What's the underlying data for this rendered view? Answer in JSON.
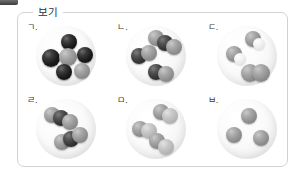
{
  "frame": {
    "legend_label": "보기",
    "border_color": "#d2d2d2",
    "background_color": "#ffffff"
  },
  "atom_colors": {
    "black": "#141414",
    "dark": "#333333",
    "gray": "#9a9a9a",
    "light_gray": "#c2c2c2",
    "white": "#f2f2f2"
  },
  "panels": [
    {
      "label": "ㄱ.",
      "name": "panel-g",
      "description": "six separate atoms: three black, three gray",
      "molecule_count": 6,
      "atom_count": 6,
      "molecules": [
        {
          "atoms": [
            {
              "type": "black",
              "x": 25,
              "y": 8,
              "r": 8
            }
          ]
        },
        {
          "atoms": [
            {
              "type": "black",
              "x": 6,
              "y": 23,
              "r": 9
            }
          ]
        },
        {
          "atoms": [
            {
              "type": "gray",
              "x": 23,
              "y": 22,
              "r": 9
            }
          ]
        },
        {
          "atoms": [
            {
              "type": "black",
              "x": 41,
              "y": 21,
              "r": 8
            }
          ]
        },
        {
          "atoms": [
            {
              "type": "black",
              "x": 20,
              "y": 38,
              "r": 8
            }
          ]
        },
        {
          "atoms": [
            {
              "type": "gray",
              "x": 38,
              "y": 37,
              "r": 8
            }
          ]
        }
      ]
    },
    {
      "label": "ㄴ.",
      "name": "panel-n",
      "description": "one triatomic gray-dark-gray molecule and two diatomic dark-gray molecules",
      "molecule_count": 3,
      "atom_count": 7,
      "molecules": [
        {
          "atoms": [
            {
              "type": "gray",
              "x": 22,
              "y": 4,
              "r": 8
            },
            {
              "type": "dark",
              "x": 31,
              "y": 9,
              "r": 8
            },
            {
              "type": "gray",
              "x": 40,
              "y": 13,
              "r": 8
            }
          ]
        },
        {
          "atoms": [
            {
              "type": "dark",
              "x": 5,
              "y": 22,
              "r": 8
            },
            {
              "type": "gray",
              "x": 15,
              "y": 19,
              "r": 8
            }
          ]
        },
        {
          "atoms": [
            {
              "type": "dark",
              "x": 22,
              "y": 38,
              "r": 8
            },
            {
              "type": "gray",
              "x": 32,
              "y": 40,
              "r": 8
            }
          ]
        }
      ]
    },
    {
      "label": "ㄷ.",
      "name": "panel-d",
      "description": "two dark atoms each bonded to a white atom, plus one diatomic gray molecule",
      "molecule_count": 3,
      "atom_count": 6,
      "molecules": [
        {
          "atoms": [
            {
              "type": "gray",
              "x": 28,
              "y": 5,
              "r": 8
            },
            {
              "type": "white",
              "x": 36,
              "y": 12,
              "r": 6
            }
          ]
        },
        {
          "atoms": [
            {
              "type": "gray",
              "x": 9,
              "y": 20,
              "r": 8
            },
            {
              "type": "white",
              "x": 17,
              "y": 27,
              "r": 6
            }
          ]
        },
        {
          "atoms": [
            {
              "type": "gray",
              "x": 24,
              "y": 38,
              "r": 9
            },
            {
              "type": "gray",
              "x": 35,
              "y": 38,
              "r": 9
            }
          ]
        }
      ]
    },
    {
      "label": "ㄹ.",
      "name": "panel-r",
      "description": "two identical triatomic gray-dark-gray molecules",
      "molecule_count": 2,
      "atom_count": 6,
      "molecules": [
        {
          "atoms": [
            {
              "type": "gray",
              "x": 8,
              "y": 8,
              "r": 8
            },
            {
              "type": "dark",
              "x": 17,
              "y": 11,
              "r": 8
            },
            {
              "type": "gray",
              "x": 26,
              "y": 15,
              "r": 8
            }
          ]
        },
        {
          "atoms": [
            {
              "type": "gray",
              "x": 18,
              "y": 35,
              "r": 8
            },
            {
              "type": "dark",
              "x": 27,
              "y": 32,
              "r": 8
            },
            {
              "type": "gray",
              "x": 36,
              "y": 28,
              "r": 8
            }
          ]
        }
      ]
    },
    {
      "label": "ㅁ.",
      "name": "panel-m",
      "description": "three identical diatomic molecules, each a gray atom bonded to a light gray atom",
      "molecule_count": 3,
      "atom_count": 6,
      "molecules": [
        {
          "atoms": [
            {
              "type": "gray",
              "x": 27,
              "y": 5,
              "r": 8
            },
            {
              "type": "lgray",
              "x": 36,
              "y": 9,
              "r": 8
            }
          ]
        },
        {
          "atoms": [
            {
              "type": "gray",
              "x": 6,
              "y": 22,
              "r": 8
            },
            {
              "type": "lgray",
              "x": 15,
              "y": 24,
              "r": 8
            }
          ]
        },
        {
          "atoms": [
            {
              "type": "gray",
              "x": 23,
              "y": 34,
              "r": 8
            },
            {
              "type": "lgray",
              "x": 32,
              "y": 40,
              "r": 8
            }
          ]
        }
      ]
    },
    {
      "label": "ㅂ.",
      "name": "panel-b",
      "description": "three separate gray atoms",
      "molecule_count": 3,
      "atom_count": 3,
      "molecules": [
        {
          "atoms": [
            {
              "type": "gray",
              "x": 24,
              "y": 9,
              "r": 8
            }
          ]
        },
        {
          "atoms": [
            {
              "type": "gray",
              "x": 9,
              "y": 28,
              "r": 8
            }
          ]
        },
        {
          "atoms": [
            {
              "type": "gray",
              "x": 36,
              "y": 31,
              "r": 8
            }
          ]
        }
      ]
    }
  ]
}
